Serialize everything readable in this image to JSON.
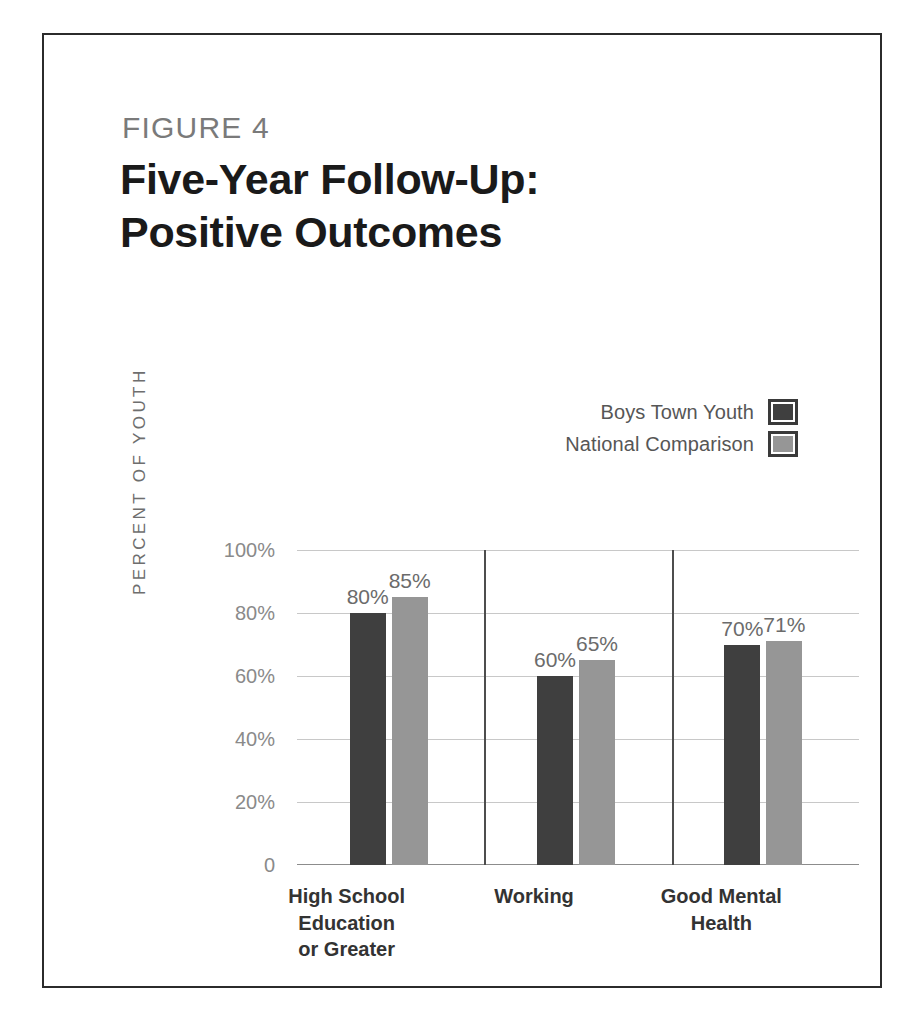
{
  "figure": {
    "label": "FIGURE 4",
    "title": "Five-Year Follow-Up:\nPositive Outcomes",
    "title_line1": "Five-Year Follow-Up:",
    "title_line2": "Positive Outcomes"
  },
  "legend": {
    "items": [
      {
        "label": "Boys Town Youth",
        "color": "#3f3f3f"
      },
      {
        "label": "National Comparison",
        "color": "#969696"
      }
    ]
  },
  "chart_data": {
    "type": "bar",
    "title": "Five-Year Follow-Up: Positive Outcomes",
    "subtitle": "FIGURE 4",
    "xlabel": "",
    "ylabel": "PERCENT OF YOUTH",
    "ylim": [
      0,
      100
    ],
    "grid": true,
    "legend_position": "top-right",
    "categories": [
      "High School Education or Greater",
      "Working",
      "Good Mental Health"
    ],
    "category_lines": [
      "High School\nEducation\nor Greater",
      "Working",
      "Good Mental\nHealth"
    ],
    "series": [
      {
        "name": "Boys Town Youth",
        "color": "#3f3f3f",
        "values": [
          80,
          60,
          70
        ],
        "labels": [
          "80%",
          "60%",
          "70%"
        ]
      },
      {
        "name": "National Comparison",
        "color": "#969696",
        "values": [
          85,
          65,
          71
        ],
        "labels": [
          "85%",
          "65%",
          "71%"
        ]
      }
    ],
    "yticks": [
      100,
      80,
      60,
      40,
      20,
      0
    ],
    "ytick_labels": [
      "100%",
      "80%",
      "60%",
      "40%",
      "20%",
      "0"
    ]
  },
  "axis": {
    "y_title": "PERCENT OF YOUTH"
  }
}
